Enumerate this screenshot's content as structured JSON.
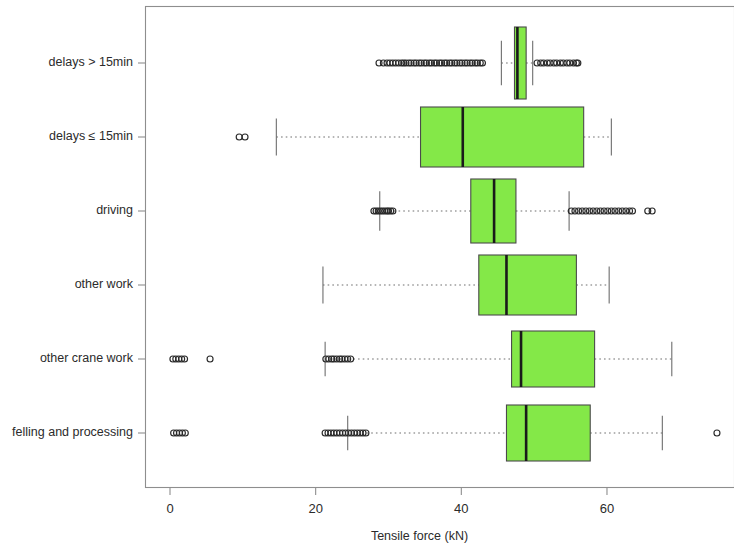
{
  "chart_data": {
    "type": "box",
    "title": "",
    "xlabel": "Tensile force (kN)",
    "ylabel": "",
    "orientation": "horizontal",
    "grid": false,
    "legend": false,
    "xlim": [
      -2.3,
      78.0
    ],
    "xticks": [
      0,
      20,
      40,
      60
    ],
    "xticklabels": [
      "0",
      "20",
      "40",
      "60"
    ],
    "box_fill_color": "#84E848",
    "box_border_color": "#4b4b4b",
    "median_color": "#1a1a1a",
    "categories": [
      "delays > 15min",
      "delays ≤ 15min",
      "driving",
      "other work",
      "other crane work",
      "felling and processing"
    ],
    "boxes": [
      {
        "label": "delays > 15min",
        "whisker_low": 45.5,
        "q1": 47.3,
        "median": 47.7,
        "q3": 48.9,
        "whisker_high": 49.8,
        "outliers": [
          28.7,
          29.3,
          29.8,
          30.2,
          30.6,
          31.0,
          31.4,
          31.8,
          32.1,
          32.4,
          32.8,
          33.1,
          33.5,
          33.8,
          34.2,
          34.5,
          34.9,
          35.2,
          35.6,
          35.9,
          36.3,
          36.6,
          37.0,
          37.3,
          37.7,
          38.0,
          38.4,
          38.7,
          39.1,
          39.4,
          39.8,
          40.1,
          40.5,
          40.8,
          41.2,
          41.5,
          41.9,
          42.2,
          42.6,
          42.9,
          50.4,
          50.9,
          51.3,
          51.8,
          52.2,
          52.7,
          53.1,
          53.6,
          54.0,
          54.5,
          54.9,
          55.4,
          55.8,
          56.0
        ]
      },
      {
        "label": "delays ≤ 15min",
        "whisker_low": 14.6,
        "q1": 34.4,
        "median": 40.2,
        "q3": 56.8,
        "whisker_high": 60.6,
        "outliers": [
          9.5,
          10.3
        ]
      },
      {
        "label": "driving",
        "whisker_low": 28.8,
        "q1": 41.3,
        "median": 44.5,
        "q3": 47.5,
        "whisker_high": 54.8,
        "outliers": [
          28.0,
          28.3,
          28.6,
          28.9,
          29.2,
          29.5,
          29.8,
          30.0,
          30.3,
          30.6,
          55.1,
          55.6,
          56.1,
          56.6,
          57.1,
          57.6,
          58.1,
          58.6,
          59.1,
          59.6,
          60.1,
          60.6,
          61.1,
          61.6,
          62.1,
          62.6,
          63.1,
          63.5,
          65.6,
          66.2
        ]
      },
      {
        "label": "other work",
        "whisker_low": 21.0,
        "q1": 42.4,
        "median": 46.2,
        "q3": 55.8,
        "whisker_high": 60.3,
        "outliers": []
      },
      {
        "label": "other crane work",
        "whisker_low": 21.3,
        "q1": 46.9,
        "median": 48.2,
        "q3": 58.3,
        "whisker_high": 68.9,
        "outliers": [
          0.4,
          0.8,
          1.2,
          1.6,
          2.0,
          5.5,
          21.4,
          21.8,
          22.2,
          22.5,
          22.9,
          23.3,
          23.6,
          24.0,
          24.4,
          24.8
        ]
      },
      {
        "label": "felling and processing",
        "whisker_low": 24.4,
        "q1": 46.2,
        "median": 48.9,
        "q3": 57.7,
        "whisker_high": 67.6,
        "outliers": [
          0.5,
          0.9,
          1.3,
          1.7,
          2.1,
          21.3,
          21.7,
          22.1,
          22.5,
          22.9,
          23.3,
          23.7,
          24.1,
          24.5,
          24.9,
          25.3,
          25.7,
          26.1,
          26.5,
          26.9,
          75.1
        ]
      }
    ]
  },
  "axis": {
    "x_title": "Tensile force (kN)",
    "x_ticklabels": [
      "0",
      "20",
      "40",
      "60"
    ]
  }
}
